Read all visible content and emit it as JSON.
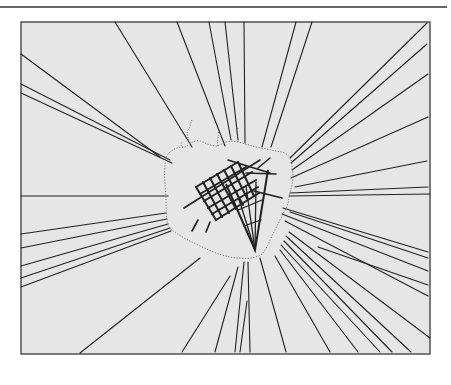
{
  "figure": {
    "title": "",
    "caption": "",
    "colors": {
      "page": "#ffffff",
      "field": "#e6e6e6",
      "line": "#222222",
      "frame": "#3a3a3a",
      "boundary": "#777777",
      "rule": "#333333"
    },
    "rule": {
      "x1": 0,
      "x2": 447,
      "y": 7
    },
    "frame": {
      "x": 21,
      "y": 22,
      "width": 409,
      "height": 332
    },
    "center": {
      "x": 238,
      "y": 200
    },
    "rays": [
      [
        21,
        54,
        160,
        157
      ],
      [
        21,
        84,
        170,
        160
      ],
      [
        21,
        93,
        172,
        163
      ],
      [
        115,
        22,
        192,
        147
      ],
      [
        177,
        22,
        225,
        146
      ],
      [
        209,
        22,
        231,
        140
      ],
      [
        225,
        22,
        238,
        140
      ],
      [
        244,
        22,
        245,
        143
      ],
      [
        296,
        22,
        262,
        147
      ],
      [
        312,
        22,
        271,
        147
      ],
      [
        427,
        23,
        290,
        158
      ],
      [
        427,
        44,
        291,
        163
      ],
      [
        428,
        74,
        292,
        170
      ],
      [
        428,
        117,
        291,
        178
      ],
      [
        427,
        161,
        295,
        187
      ],
      [
        428,
        187,
        290,
        193
      ],
      [
        430,
        194,
        289,
        196
      ],
      [
        21,
        196,
        168,
        196
      ],
      [
        21,
        234,
        166,
        213
      ],
      [
        21,
        248,
        167,
        219
      ],
      [
        21,
        266,
        168,
        224
      ],
      [
        21,
        278,
        170,
        228
      ],
      [
        21,
        287,
        171,
        231
      ],
      [
        428,
        252,
        283,
        208
      ],
      [
        428,
        258,
        290,
        212
      ],
      [
        428,
        271,
        282,
        214
      ],
      [
        428,
        285,
        318,
        247
      ],
      [
        428,
        296,
        285,
        221
      ],
      [
        80,
        353,
        200,
        258
      ],
      [
        182,
        352,
        230,
        276
      ],
      [
        215,
        352,
        238,
        267
      ],
      [
        235,
        352,
        244,
        262
      ],
      [
        240,
        352,
        247,
        301
      ],
      [
        250,
        352,
        248,
        262
      ],
      [
        286,
        352,
        260,
        258
      ],
      [
        330,
        352,
        275,
        256
      ],
      [
        358,
        352,
        280,
        250
      ],
      [
        380,
        352,
        281,
        245
      ],
      [
        392,
        352,
        284,
        241
      ],
      [
        411,
        352,
        286,
        236
      ],
      [
        430,
        338,
        289,
        232
      ]
    ],
    "boundary_path": "M166,157 C170,150 178,146 186,147 C190,142 196,140 200,141 C206,143 210,146 218,146 C224,142 230,140 238,142 C246,144 252,146 260,148 C268,149 274,151 282,152 C288,154 292,158 292,166 C294,176 293,184 290,192 C289,200 288,206 284,212 C280,220 276,228 272,236 C268,244 266,250 262,254 C256,258 248,259 240,258 C232,258 224,256 216,253 C206,249 196,244 188,240 C180,236 172,231 168,226 C166,216 166,206 166,196 C165,186 164,174 165,164 Z",
    "north_traces": [
      "M190,143 C188,138 186,134 188,130 C191,127 190,123 192,120",
      "M218,146 C216,140 220,136 218,131",
      "M238,142 C238,137 236,133 238,128",
      "M183,148 C181,146 180,144 182,142"
    ],
    "grid": {
      "streets_a": [
        [
          196,
          187,
          238,
          162
        ],
        [
          200,
          194,
          246,
          167
        ],
        [
          204,
          201,
          252,
          172
        ],
        [
          208,
          208,
          256,
          180
        ],
        [
          212,
          214,
          258,
          187
        ],
        [
          216,
          220,
          259,
          193
        ]
      ],
      "streets_b": [
        [
          196,
          187,
          216,
          220
        ],
        [
          203,
          182,
          222,
          217
        ],
        [
          210,
          178,
          229,
          213
        ],
        [
          217,
          174,
          236,
          209
        ],
        [
          224,
          170,
          243,
          205
        ],
        [
          231,
          166,
          248,
          200
        ],
        [
          238,
          162,
          254,
          196
        ]
      ],
      "extra_streets": [
        [
          184,
          208,
          260,
          160
        ],
        [
          228,
          160,
          270,
          173
        ],
        [
          258,
          168,
          270,
          158
        ],
        [
          198,
          220,
          192,
          231
        ],
        [
          210,
          222,
          206,
          232
        ],
        [
          246,
          173,
          276,
          174
        ]
      ],
      "wedge": {
        "apex": [
          255,
          250
        ],
        "left": [
          226,
          184
        ],
        "right": [
          268,
          170
        ],
        "inner_lines": [
          [
            255,
            250,
            236,
            190
          ],
          [
            255,
            250,
            246,
            186
          ],
          [
            255,
            250,
            256,
            182
          ],
          [
            238,
            210,
            262,
            200
          ],
          [
            244,
            226,
            261,
            220
          ]
        ]
      },
      "spur": [
        254,
        191,
        282,
        198
      ]
    }
  }
}
